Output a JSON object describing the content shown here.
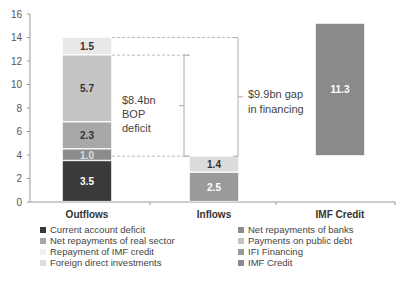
{
  "chart_data": {
    "type": "bar",
    "subtype": "stacked-waterfall",
    "title": "",
    "xlabel": "",
    "ylabel": "",
    "ylim": [
      0,
      16
    ],
    "yticks": [
      0,
      2,
      4,
      6,
      8,
      10,
      12,
      14,
      16
    ],
    "grid": false,
    "legend_position": "bottom",
    "categories": [
      "Outflows",
      "Inflows",
      "IMF Credit"
    ],
    "bars": [
      {
        "category": "Outflows",
        "segments": [
          {
            "series": "Current account deficit",
            "base": 0,
            "value": 3.5,
            "label": "3.5",
            "color": "#3a3a3a",
            "label_color": "#ffffff"
          },
          {
            "series": "Net repayments of banks",
            "base": 3.5,
            "value": 1.0,
            "label": "1.0",
            "color": "#8c8c8c",
            "label_color": "#dddddd"
          },
          {
            "series": "Net repayments of real sector",
            "base": 4.5,
            "value": 2.3,
            "label": "2.3",
            "color": "#a8a8a8",
            "label_color": "#333333"
          },
          {
            "series": "Payments on public debt",
            "base": 6.8,
            "value": 5.7,
            "label": "5.7",
            "color": "#c4c4c4",
            "label_color": "#333333"
          },
          {
            "series": "Repayment of IMF credit",
            "base": 12.5,
            "value": 1.5,
            "label": "1.5",
            "color": "#e8e8e8",
            "label_color": "#333333"
          }
        ]
      },
      {
        "category": "Inflows",
        "segments": [
          {
            "series": "IFI Financing",
            "base": 0,
            "value": 2.5,
            "label": "2.5",
            "color": "#9a9a9a",
            "label_color": "#ffffff"
          },
          {
            "series": "Foreign direct investments",
            "base": 2.5,
            "value": 1.4,
            "label": "1.4",
            "color": "#dcdcdc",
            "label_color": "#333333"
          }
        ]
      },
      {
        "category": "IMF Credit",
        "segments": [
          {
            "series": "IMF Credit",
            "base": 3.9,
            "value": 11.3,
            "label": "11.3",
            "color": "#8a8a8a",
            "label_color": "#ffffff"
          }
        ]
      }
    ],
    "annotations": [
      {
        "text_lines": [
          "$8.4bn",
          "BOP",
          "deficit"
        ],
        "from": 4.5,
        "to": 12.5
      },
      {
        "text_lines": [
          "$9.9bn gap",
          "in financing"
        ],
        "from": 3.9,
        "to": 14.0
      }
    ],
    "legend": [
      {
        "label": "Current account deficit",
        "color": "#3a3a3a"
      },
      {
        "label": "Net repayments of banks",
        "color": "#8c8c8c"
      },
      {
        "label": "Net repayments of real sector",
        "color": "#a8a8a8"
      },
      {
        "label": "Payments on public debt",
        "color": "#c4c4c4"
      },
      {
        "label": "Repayment of IMF credit",
        "color": "#e8e8e8"
      },
      {
        "label": "IFI Financing",
        "color": "#9a9a9a"
      },
      {
        "label": "Foreign direct investments",
        "color": "#dcdcdc"
      },
      {
        "label": "IMF Credit",
        "color": "#8a8a8a"
      }
    ]
  },
  "legend_labels": {
    "current_account_deficit": "Current account deficit",
    "net_repayments_banks": "Net repayments of banks",
    "net_repayments_real_sector": "Net repayments of real sector",
    "payments_public_debt": "Payments on public debt",
    "repayment_imf_credit": "Repayment of IMF credit",
    "ifi_financing": "IFI Financing",
    "fdi": "Foreign direct investments",
    "imf_credit": "IMF Credit"
  }
}
